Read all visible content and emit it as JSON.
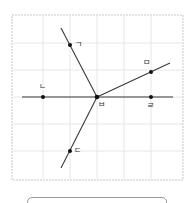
{
  "diagram": {
    "type": "geometry-grid",
    "panel": {
      "x": 12,
      "y": 15,
      "width": 171,
      "height": 165,
      "border_color": "#e3e3e3",
      "background": "#ffffff"
    },
    "grid": {
      "color": "#e6e6e6",
      "vertical_x": [
        43,
        70,
        97,
        124,
        151
      ],
      "horizontal_y": [
        43,
        70,
        97,
        124,
        151
      ]
    },
    "colors": {
      "line": "#3a3a3a",
      "point": "#111111",
      "label": "#333333"
    },
    "center": {
      "label": "ㅂ",
      "x": 97,
      "y": 97
    },
    "points": [
      {
        "label": "ㄱ",
        "x": 70,
        "y": 45
      },
      {
        "label": "ㄴ",
        "x": 43,
        "y": 97
      },
      {
        "label": "ㄷ",
        "x": 70,
        "y": 151
      },
      {
        "label": "ㄹ",
        "x": 151,
        "y": 97
      },
      {
        "label": "ㅁ",
        "x": 151,
        "y": 72
      }
    ],
    "lines": [
      {
        "name": "line-horizontal",
        "from": [
          22,
          97
        ],
        "to": [
          173,
          97
        ]
      },
      {
        "name": "ray-giyeok",
        "from": [
          97,
          97
        ],
        "to": [
          61,
          28
        ]
      },
      {
        "name": "ray-digeut",
        "from": [
          97,
          97
        ],
        "to": [
          61,
          168
        ]
      },
      {
        "name": "ray-mieum",
        "from": [
          97,
          97
        ],
        "to": [
          170,
          63
        ]
      }
    ]
  },
  "answer_box": {
    "value": ""
  }
}
